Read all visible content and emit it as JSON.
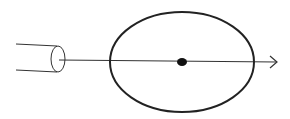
{
  "diagram": {
    "width": 290,
    "height": 119,
    "background": "#ffffff",
    "stroke_color": "#222222",
    "elements": {
      "cylinder": {
        "label": "tube",
        "top_y1": 44,
        "top_y2": 46,
        "bottom_y1": 70,
        "bottom_y2": 72,
        "x_start": 16,
        "end_cx": 58,
        "end_cy": 58,
        "end_rx": 7,
        "end_ry": 13
      },
      "axis_line": {
        "x1": 58,
        "y1": 60,
        "x2": 277,
        "y2": 62
      },
      "ellipse": {
        "cx": 182,
        "cy": 62,
        "rx": 72,
        "ry": 50
      },
      "center_dot": {
        "cx": 182,
        "cy": 62,
        "rx": 5,
        "ry": 4
      },
      "arrowhead": {
        "tip_x": 277,
        "tip_y": 62
      }
    }
  }
}
